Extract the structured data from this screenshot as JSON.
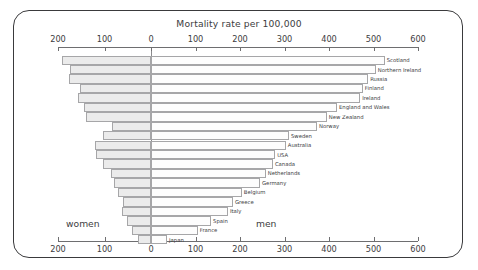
{
  "chart_data": {
    "type": "bar",
    "subtype": "butterfly-population-pyramid",
    "title": "Mortality rate per 100,000",
    "xlabel": "",
    "ylabel": "",
    "left_group_label": "women",
    "right_group_label": "men",
    "left_axis_ticks": [
      200,
      100,
      0
    ],
    "right_axis_ticks": [
      0,
      100,
      200,
      300,
      400,
      500,
      600
    ],
    "axis_tick_labels_top": [
      "200",
      "100",
      "0",
      "100",
      "200",
      "300",
      "400",
      "500",
      "600"
    ],
    "axis_tick_labels_bottom": [
      "200",
      "100",
      "0",
      "100",
      "200",
      "300",
      "400",
      "500",
      "600"
    ],
    "left_xlim": [
      200,
      0
    ],
    "right_xlim": [
      0,
      600
    ],
    "grid": false,
    "legend": "none",
    "axes_top_and_bottom": true,
    "categories": [
      "Scotland",
      "Northern Ireland",
      "Russia",
      "Finland",
      "Ireland",
      "England and Wales",
      "New Zealand",
      "Norway",
      "Sweden",
      "Australia",
      "USA",
      "Canada",
      "Netherlands",
      "Germany",
      "Belgium",
      "Greece",
      "Italy",
      "Spain",
      "France",
      "Japan"
    ],
    "series": [
      {
        "name": "women",
        "side": "left",
        "color": "#ebebeb",
        "values": [
          191,
          174,
          176,
          152,
          157,
          144,
          140,
          84,
          103,
          120,
          118,
          103,
          86,
          80,
          71,
          60,
          62,
          52,
          41,
          28
        ]
      },
      {
        "name": "men",
        "side": "right",
        "color": "#fdfdfd",
        "values": [
          525,
          505,
          488,
          476,
          470,
          418,
          395,
          373,
          310,
          303,
          279,
          274,
          258,
          245,
          204,
          184,
          173,
          135,
          105,
          36
        ]
      }
    ]
  },
  "colors": {
    "frame": "#3a3a3c",
    "axis": "#6e6e70",
    "text": "#3c3c3e",
    "bar_women_fill": "#ebebeb",
    "bar_men_fill": "#fdfdfd",
    "bar_stroke": "#a6a6a8",
    "background": "#ffffff"
  }
}
